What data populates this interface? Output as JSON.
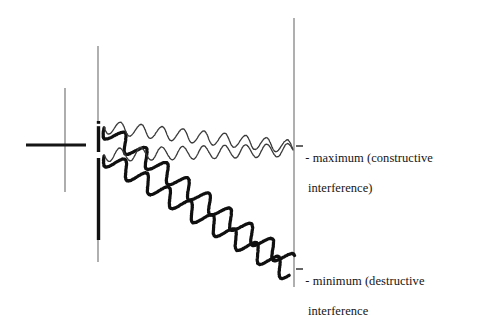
{
  "figure": {
    "background_color": "#ffffff",
    "ink_color": "#141414",
    "thin_stroke_color": "#5a5a5a",
    "canvas": {
      "width": 485,
      "height": 311
    }
  },
  "source_marker": {
    "name": "crosshair",
    "horizontal": {
      "x1": 26,
      "x2": 86,
      "y": 145,
      "stroke_width": 3.2,
      "color": "#151515"
    },
    "vertical": {
      "x": 65,
      "y1": 88,
      "y2": 192,
      "stroke_width": 1.1,
      "color": "#6b6b6b"
    }
  },
  "barrier": {
    "name": "double-slit-barrier",
    "x": 98,
    "thin_top": {
      "y1": 46,
      "y2": 121,
      "stroke_width": 1.1,
      "color": "#6e6e6e"
    },
    "thick_segments": [
      {
        "y1": 121,
        "y2": 128,
        "stroke_width": 3.4
      },
      {
        "y1": 128,
        "y2": 152,
        "stroke_width": 3.4
      },
      {
        "y1": 158,
        "y2": 240,
        "stroke_width": 3.4
      }
    ],
    "thin_bottom": {
      "y1": 240,
      "y2": 262,
      "stroke_width": 1.1,
      "color": "#6e6e6e"
    },
    "slits": [
      {
        "label": "upper-slit",
        "y_center": 125,
        "gap": 6
      },
      {
        "label": "lower-slit",
        "y_center": 155,
        "gap": 6
      }
    ]
  },
  "screen": {
    "name": "detection-screen",
    "x": 294,
    "y1": 18,
    "y2": 287,
    "stroke_width": 1.2,
    "color": "#7a7a7a"
  },
  "waves": {
    "constructive": {
      "name": "maximum-wave-pair",
      "stroke_width": 1.3,
      "color": "#3a3a3a",
      "amplitude": 6.5,
      "wavelength": 21,
      "paths": [
        {
          "id": "upper-thin-wave",
          "x_start": 104,
          "x_end": 293,
          "y_start": 127,
          "y_end": 147
        },
        {
          "id": "lower-thin-wave",
          "x_start": 104,
          "x_end": 293,
          "y_start": 155,
          "y_end": 150
        }
      ]
    },
    "destructive": {
      "name": "minimum-wave-pair",
      "stroke_width": 3.2,
      "color": "#101010",
      "amplitude": 8.5,
      "wavelength": 26,
      "paths": [
        {
          "id": "upper-thick-wave",
          "x_start": 104,
          "x_end": 290,
          "y_start": 128,
          "y_end": 262
        },
        {
          "id": "lower-thick-wave",
          "x_start": 104,
          "x_end": 290,
          "y_start": 156,
          "y_end": 274
        }
      ]
    }
  },
  "annotations": {
    "maximum": {
      "dash": "-",
      "line1": " maximum (constructive",
      "line2": "interference)"
    },
    "minimum": {
      "dash": "-",
      "line1": " minimum (destructive",
      "line2": "interference"
    }
  }
}
